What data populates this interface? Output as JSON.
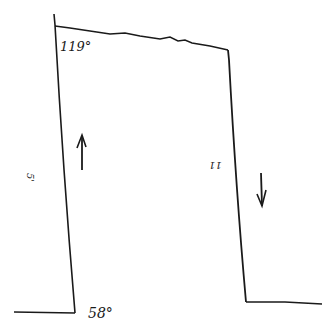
{
  "diagram": {
    "type": "hand-drawn sketch",
    "labels": {
      "top_left_angle": "119°",
      "bottom_left_angle": "58°",
      "left_side": "5'",
      "right_side": "11"
    },
    "arrows": [
      {
        "name": "up-arrow",
        "direction": "up",
        "position": "inside left"
      },
      {
        "name": "down-arrow",
        "direction": "down",
        "position": "inside right"
      }
    ],
    "stroke_color": "#1a1a1a",
    "background": "#ffffff"
  }
}
